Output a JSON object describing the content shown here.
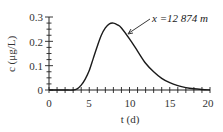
{
  "chart_data": {
    "type": "line",
    "title": "",
    "xlabel": "t (d)",
    "ylabel": "c (μg/L)",
    "xlim": [
      0,
      20
    ],
    "ylim": [
      0,
      0.3
    ],
    "xticks": [
      0,
      5,
      10,
      15,
      20
    ],
    "yticks": [
      0,
      0.1,
      0.2,
      0.3
    ],
    "x_tick_labels": [
      "0",
      "5",
      "10",
      "15",
      "20"
    ],
    "y_tick_labels": [
      "0",
      "0.1",
      "0.2",
      "0.3"
    ],
    "grid": false,
    "legend": null,
    "series": [
      {
        "name": "x =12 874 m",
        "x": [
          0,
          1,
          2,
          3,
          3.5,
          4,
          4.5,
          5,
          5.5,
          6,
          6.5,
          7,
          7.5,
          8,
          8.5,
          9,
          10,
          11,
          12,
          13,
          14,
          15,
          16,
          17,
          18,
          19,
          20
        ],
        "values": [
          0,
          0,
          0,
          0,
          0.005,
          0.02,
          0.045,
          0.08,
          0.13,
          0.18,
          0.225,
          0.255,
          0.272,
          0.275,
          0.268,
          0.255,
          0.21,
          0.16,
          0.11,
          0.075,
          0.048,
          0.03,
          0.018,
          0.01,
          0.005,
          0.002,
          0
        ]
      }
    ],
    "annotations": [
      {
        "text": "x =12 874 m",
        "points_to": {
          "x": 9.5,
          "y": 0.235
        }
      }
    ]
  },
  "labels": {
    "xlabel": "t (d)",
    "ylabel": "c (μg/L)",
    "annotation": "x =12 874 m",
    "xticks": [
      "0",
      "5",
      "10",
      "15",
      "20"
    ],
    "yticks": [
      "0",
      "0.1",
      "0.2",
      "0.3"
    ]
  }
}
